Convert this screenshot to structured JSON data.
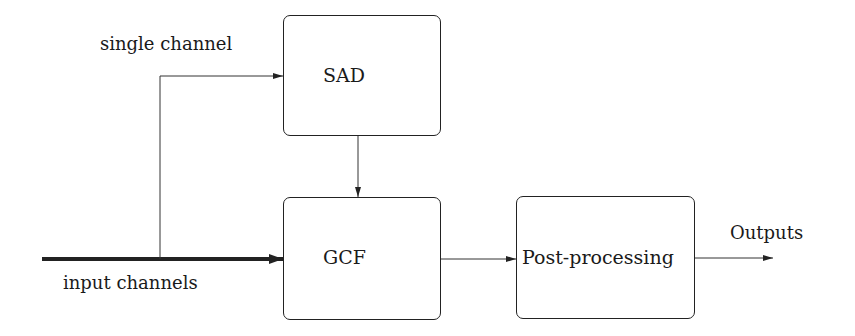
{
  "diagram": {
    "type": "block-diagram",
    "blocks": [
      {
        "id": "sad",
        "label": "SAD"
      },
      {
        "id": "gcf",
        "label": "GCF"
      },
      {
        "id": "post",
        "label": "Post-processing"
      }
    ],
    "labels": {
      "single_channel": "single channel",
      "input_channels": "input channels",
      "outputs": "Outputs"
    },
    "edges": [
      {
        "from": "input",
        "to": "gcf",
        "label": "input channels",
        "style": "thick"
      },
      {
        "from": "input",
        "to": "sad",
        "label": "single channel",
        "style": "thin"
      },
      {
        "from": "sad",
        "to": "gcf",
        "style": "thin"
      },
      {
        "from": "gcf",
        "to": "post",
        "style": "thin"
      },
      {
        "from": "post",
        "to": "output",
        "label": "Outputs",
        "style": "thin"
      }
    ]
  }
}
